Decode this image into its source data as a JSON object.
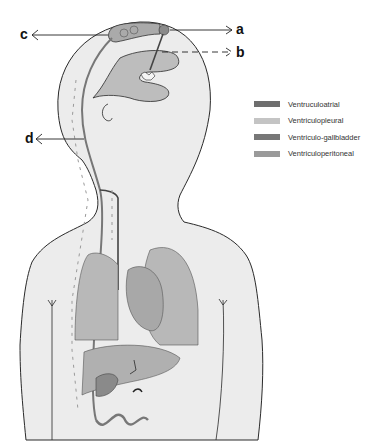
{
  "diagram": {
    "type": "anatomical-shunt-diagram",
    "labels": {
      "a": "a",
      "b": "b",
      "c": "c",
      "d": "d"
    },
    "legend": [
      {
        "label": "Ventruculoatrial",
        "color": "#6e6e6e"
      },
      {
        "label": "Ventriculopleural",
        "color": "#c4c4c4"
      },
      {
        "label": "Ventriculo-gallbladder",
        "color": "#777777"
      },
      {
        "label": "Ventriculoperitoneal",
        "color": "#9a9a9a"
      }
    ],
    "colors": {
      "body_fill": "#ececec",
      "outline": "#2a2a2a",
      "ventricle": "#bdbdbd",
      "lung": "#b8b8b8",
      "heart": "#a8a8a8",
      "liver": "#b0b0b0",
      "gallbladder": "#8a8a8a",
      "arrow": "#9a9a9a"
    }
  }
}
